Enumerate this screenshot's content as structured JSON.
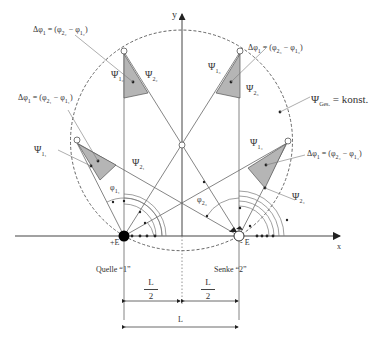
{
  "diagram": {
    "axes": {
      "x_label": "x",
      "y_label": "y"
    },
    "source": {
      "charge_label": "+E",
      "name_label": "Quelle “1”"
    },
    "sink": {
      "charge_label": "- E",
      "name_label": "Senke “2”"
    },
    "circle_label": {
      "psi": "Ψ",
      "sub": "Ges.",
      "rest": " = konst."
    },
    "delta_labels": [
      {
        "text": "Δφ₁ = (φ₂₂ − φ₁₂)",
        "main": "Δφ",
        "i": "1",
        "a": "φ",
        "asub": "2₂",
        "b": "φ",
        "bsub": "1₂"
      },
      {
        "text": "Δφ₁ = (φ₂₁ − φ₁₁)",
        "main": "Δφ",
        "i": "1",
        "a": "φ",
        "asub": "2₁",
        "b": "φ",
        "bsub": "1₁"
      },
      {
        "text": "Δφ₁ = (φ₂₃ − φ₁₃)",
        "main": "Δφ",
        "i": "1",
        "a": "φ",
        "asub": "2₃",
        "b": "φ",
        "bsub": "1₃"
      },
      {
        "text": "Δφ₁ = (φ₂₄ − φ₁₄)",
        "main": "Δφ",
        "i": "1",
        "a": "φ",
        "asub": "2₄",
        "b": "φ",
        "bsub": "1₄"
      }
    ],
    "psi_labels": [
      {
        "id": "psi-1-2",
        "sym": "Ψ",
        "sub": "1₂"
      },
      {
        "id": "psi-2-2",
        "sym": "Ψ",
        "sub": "2₂"
      },
      {
        "id": "psi-1-3",
        "sym": "Ψ",
        "sub": "1₃"
      },
      {
        "id": "psi-2-3",
        "sym": "Ψ",
        "sub": "2₃"
      },
      {
        "id": "psi-1-1",
        "sym": "Ψ",
        "sub": "1₁"
      },
      {
        "id": "psi-2-1",
        "sym": "Ψ",
        "sub": "2₁"
      },
      {
        "id": "psi-1-4",
        "sym": "Ψ",
        "sub": "1₄"
      },
      {
        "id": "psi-2-4",
        "sym": "Ψ",
        "sub": "2₄"
      }
    ],
    "angle_labels": [
      {
        "sym": "φ",
        "sub": "1₁"
      },
      {
        "sym": "φ",
        "sub": "2₃"
      }
    ],
    "dimensions": {
      "half_num": "L",
      "half_den": "2",
      "full": "L"
    },
    "colors": {
      "line": "#555555",
      "fill": "#b5b5b5",
      "dashed": "#555555"
    }
  }
}
